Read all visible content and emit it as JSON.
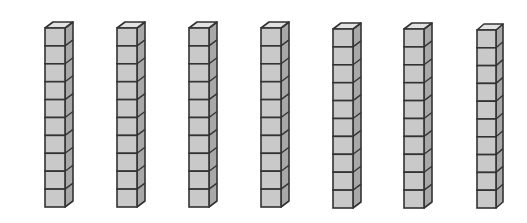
{
  "diagram": {
    "rod_count": 7,
    "cubes_per_rod": 10,
    "total_cubes": 70,
    "colors": {
      "front": "#c9c9c9",
      "side": "#a8a8a8",
      "top": "#e2e2e2",
      "stroke": "#333333",
      "background": "#ffffff"
    },
    "rods": [
      {
        "x": 45,
        "top": 28,
        "cube_w": 20,
        "cube_h": 17.9,
        "depth_x": 8,
        "depth_y": 6
      },
      {
        "x": 117,
        "top": 28,
        "cube_w": 20,
        "cube_h": 17.9,
        "depth_x": 8,
        "depth_y": 6
      },
      {
        "x": 189,
        "top": 28,
        "cube_w": 20,
        "cube_h": 17.9,
        "depth_x": 8,
        "depth_y": 6
      },
      {
        "x": 261,
        "top": 28,
        "cube_w": 20,
        "cube_h": 17.9,
        "depth_x": 8,
        "depth_y": 6
      },
      {
        "x": 333,
        "top": 29,
        "cube_w": 20,
        "cube_h": 17.9,
        "depth_x": 8,
        "depth_y": 6
      },
      {
        "x": 404,
        "top": 29,
        "cube_w": 20,
        "cube_h": 17.9,
        "depth_x": 8,
        "depth_y": 6
      },
      {
        "x": 477,
        "top": 30,
        "cube_w": 19,
        "cube_h": 17.8,
        "depth_x": 7,
        "depth_y": 6
      }
    ]
  }
}
